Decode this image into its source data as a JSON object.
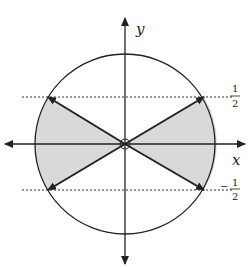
{
  "diagram": {
    "type": "unit-circle-region",
    "axes": {
      "x_label": "x",
      "y_label": "y"
    },
    "reference_lines": [
      {
        "label_num": "1",
        "label_den": "2",
        "sign": ""
      },
      {
        "label_num": "1",
        "label_den": "2",
        "sign": "−"
      }
    ],
    "shaded_region": "sectors where |y| <= 1/2 (left and right)",
    "colors": {
      "stroke": "#222222",
      "shade": "#d9d9d9",
      "background": "#ffffff"
    }
  }
}
